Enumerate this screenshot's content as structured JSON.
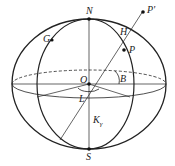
{
  "diagram": {
    "labels": {
      "N": "N",
      "S": "S",
      "G": "G",
      "H": "H",
      "P": "P",
      "P_prime": "P'",
      "O": "O",
      "B": "B",
      "L": "L",
      "K": "K",
      "K_sub": "γ"
    },
    "colors": {
      "stroke": "#222222",
      "background": "#ffffff"
    }
  }
}
